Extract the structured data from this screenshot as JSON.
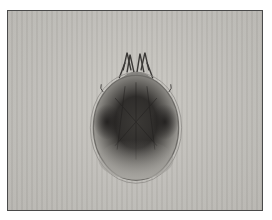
{
  "image": {
    "subject": "mite specimen under light microscope",
    "view": "dorsal",
    "background_color": "#bebcb7",
    "frame_color": "#4a4a4a",
    "body_outline_color": "#6e6c68",
    "body_dark_color": "#2e2c2a"
  }
}
